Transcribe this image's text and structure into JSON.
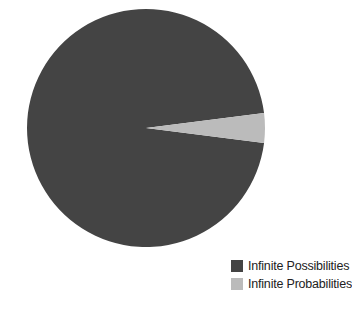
{
  "chart_data": {
    "type": "pie",
    "title": "",
    "categories": [
      "Infinite Possibilities",
      "Infinite Probabilities"
    ],
    "values": [
      96,
      4
    ],
    "colors": [
      "#444444",
      "#bbbbbb"
    ],
    "legend_position": "bottom-right",
    "start_angle_deg": -7,
    "center": [
      146,
      128
    ],
    "radius": 119
  },
  "legend": {
    "items": [
      {
        "label": "Infinite Possibilities",
        "color": "#444444"
      },
      {
        "label": "Infinite Probabilities",
        "color": "#bbbbbb"
      }
    ]
  }
}
